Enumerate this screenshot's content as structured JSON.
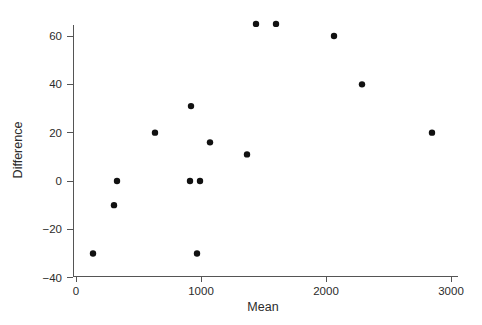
{
  "chart_data": {
    "type": "scatter",
    "title": "",
    "xlabel": "Mean",
    "ylabel": "Difference",
    "xlim": [
      0,
      3050
    ],
    "ylim": [
      -42,
      68
    ],
    "grid": false,
    "legend": null,
    "x_ticks": [
      0,
      1000,
      2000,
      3000
    ],
    "x_tick_labels": [
      "0",
      "1000",
      "2000",
      "3000"
    ],
    "y_ticks": [
      -40,
      -20,
      0,
      20,
      40,
      60
    ],
    "y_tick_labels": [
      "−40",
      "−20",
      "0",
      "20",
      "40",
      "60"
    ],
    "marker": {
      "shape": "circle",
      "color": "#111111",
      "size_px": 3.2
    },
    "points": [
      {
        "mean": 136,
        "difference": -30
      },
      {
        "mean": 304,
        "difference": -10
      },
      {
        "mean": 328,
        "difference": 0
      },
      {
        "mean": 632,
        "difference": 20
      },
      {
        "mean": 912,
        "difference": 0
      },
      {
        "mean": 920,
        "difference": 31
      },
      {
        "mean": 968,
        "difference": -30
      },
      {
        "mean": 992,
        "difference": 0
      },
      {
        "mean": 1072,
        "difference": 16
      },
      {
        "mean": 1368,
        "difference": 11
      },
      {
        "mean": 1440,
        "difference": 65
      },
      {
        "mean": 1600,
        "difference": 65
      },
      {
        "mean": 2064,
        "difference": 60
      },
      {
        "mean": 2288,
        "difference": 40
      },
      {
        "mean": 2848,
        "difference": 20
      }
    ]
  },
  "colors": {
    "marker": "#111111",
    "axis": "#555555",
    "text": "#2b2b2b",
    "background": "#ffffff"
  }
}
